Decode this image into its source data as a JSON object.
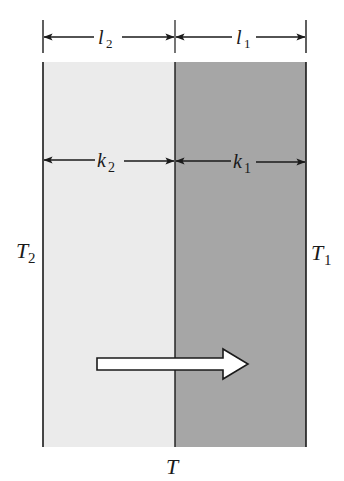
{
  "figure": {
    "type": "composite-wall-heat-conduction",
    "colors": {
      "background": "#ffffff",
      "slab_left": "#ebebeb",
      "slab_right": "#a6a6a6",
      "lines": "#1a1a1a",
      "flow_arrow_fill": "#ffffff"
    }
  },
  "dimensions": {
    "top": [
      {
        "symbol": "l",
        "subscript": "2",
        "label": "l2"
      },
      {
        "symbol": "l",
        "subscript": "1",
        "label": "l1"
      }
    ],
    "conductivity": [
      {
        "symbol": "k",
        "subscript": "2",
        "label": "k2"
      },
      {
        "symbol": "k",
        "subscript": "1",
        "label": "k1"
      }
    ]
  },
  "temperatures": {
    "left": {
      "symbol": "T",
      "subscript": "2",
      "label": "T2"
    },
    "right": {
      "symbol": "T",
      "subscript": "1",
      "label": "T1"
    },
    "interface": {
      "symbol": "T",
      "label": "T"
    }
  },
  "heat_flow": {
    "direction": "right",
    "icon": "hollow-arrow-right-icon"
  }
}
